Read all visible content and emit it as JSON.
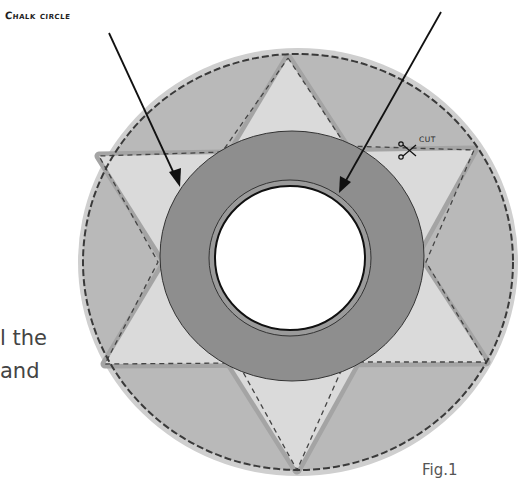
{
  "figure": {
    "caption": "Fig.1",
    "labels": {
      "chalk_circle": "Chalk circle",
      "cut": "CUT"
    },
    "body_text_fragment": [
      "l the",
      "and"
    ],
    "parts": [
      {
        "name": "outer-circle",
        "fill": "#b9b9b9",
        "outline": "dashed"
      },
      {
        "name": "six-point-star",
        "fill": "#d9d9d9",
        "outline": "dashed"
      },
      {
        "name": "ring",
        "fill": "#8d8d8d"
      },
      {
        "name": "center-hole",
        "fill": "#ffffff"
      }
    ],
    "colors": {
      "outer_fill": "#b8b8b8",
      "outer_halo": "#cdcdcd",
      "star_fill": "#dadada",
      "star_band": "#a6a6a6",
      "ring_fill": "#8e8e8e",
      "hole_fill": "#ffffff",
      "line": "#222222"
    }
  }
}
